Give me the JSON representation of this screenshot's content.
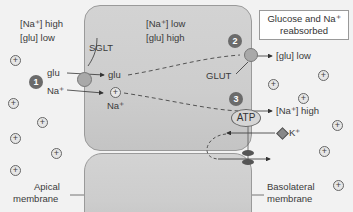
{
  "apical_side": {
    "conditions": [
      "[Na⁺] high",
      "[glu] low"
    ],
    "glu_label": "glu",
    "na_label": "Na⁺",
    "membrane_label": [
      "Apical",
      "membrane"
    ]
  },
  "cell": {
    "conditions": [
      "[Na⁺] low",
      "[glu] high"
    ],
    "glu_label": "glu",
    "na_label": "Na⁺",
    "sglt_label": "SGLT",
    "glut_label": "GLUT",
    "atp_label": "ATP"
  },
  "basolateral_side": {
    "glu_out_label": "[glu] low",
    "na_out_label": "[Na⁺] high",
    "k_label": "K⁺",
    "membrane_label": [
      "Basolateral",
      "membrane"
    ]
  },
  "callout": {
    "lines": [
      "Glucose and Na⁺",
      "reabsorbed"
    ]
  },
  "steps": [
    "1",
    "2",
    "3"
  ],
  "ion_symbol": "+",
  "colors": {
    "background": "#f2f2f2",
    "cell_fill": "#cfcfcf",
    "step_badge": "#6b6b6b",
    "transporter": "#a9a9a9"
  }
}
